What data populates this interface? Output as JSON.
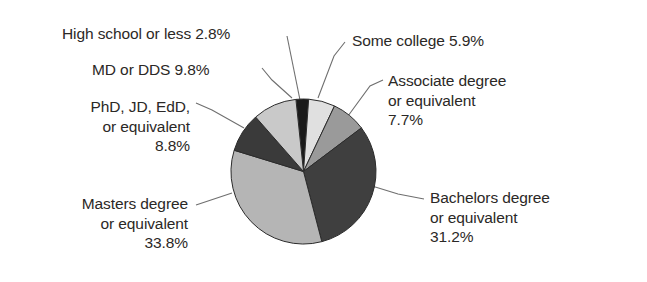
{
  "figure": {
    "background_color": "#ffffff",
    "text_color": "#2b2826",
    "leader_line_color": "#6f6f6f"
  },
  "chart_data": {
    "type": "pie",
    "title": "",
    "xlabel": "",
    "ylabel": "",
    "legend_position": "callout-labels",
    "grid": false,
    "units": "percent",
    "start_angle_deg": -96,
    "direction": "clockwise",
    "categories": [
      "High school or less",
      "Some college",
      "Associate degree or equivalent",
      "Bachelors degree or equivalent",
      "Masters degree or equivalent",
      "PhD, JD, EdD, or equivalent",
      "MD or DDS"
    ],
    "values": [
      2.8,
      5.9,
      7.7,
      31.2,
      33.8,
      8.8,
      9.8
    ],
    "value_labels": [
      "2.8%",
      "5.9%",
      "7.7%",
      "31.2%",
      "33.8%",
      "8.8%",
      "9.8%"
    ],
    "slice_colors": [
      "#1a1a1a",
      "#e0e0e0",
      "#9a9a9a",
      "#3f3f3f",
      "#b5b5b5",
      "#3a3a3a",
      "#c9c9c9"
    ],
    "slice_edge_color": "#2b2b2b"
  },
  "labels": {
    "high_school": "High school or less 2.8%",
    "md_dds": "MD or DDS 9.8%",
    "phd": "PhD, JD, EdD,\nor equivalent\n8.8%",
    "masters": "Masters degree\nor equivalent\n33.8%",
    "some_college": "Some college 5.9%",
    "associate": "Associate degree\nor equivalent\n7.7%",
    "bachelors": "Bachelors degree\nor equivalent\n31.2%"
  }
}
